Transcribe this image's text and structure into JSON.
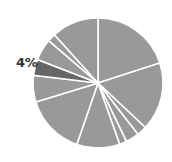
{
  "chart_data": {
    "type": "pie",
    "title": "",
    "start_angle_deg": 0,
    "direction": "clockwise",
    "slices": [
      {
        "value": 20.0,
        "color": "#999999",
        "label": ""
      },
      {
        "value": 17.0,
        "color": "#999999",
        "label": ""
      },
      {
        "value": 2.5,
        "color": "#999999",
        "label": ""
      },
      {
        "value": 3.3,
        "color": "#999999",
        "label": ""
      },
      {
        "value": 1.8,
        "color": "#999999",
        "label": ""
      },
      {
        "value": 10.7,
        "color": "#999999",
        "label": ""
      },
      {
        "value": 15.0,
        "color": "#999999",
        "label": ""
      },
      {
        "value": 6.6,
        "color": "#999999",
        "label": ""
      },
      {
        "value": 4.0,
        "color": "#666666",
        "label": "4%",
        "highlighted": true
      },
      {
        "value": 5.4,
        "color": "#999999",
        "label": ""
      },
      {
        "value": 2.0,
        "color": "#999999",
        "label": ""
      },
      {
        "value": 11.7,
        "color": "#999999",
        "label": ""
      }
    ],
    "annotations": [
      "4%"
    ],
    "legend": null
  },
  "label": {
    "text": "4%"
  },
  "geometry": {
    "cx": 98,
    "cy": 83,
    "r": 65,
    "separator_color": "#ffffff",
    "separator_width": 1.6
  }
}
